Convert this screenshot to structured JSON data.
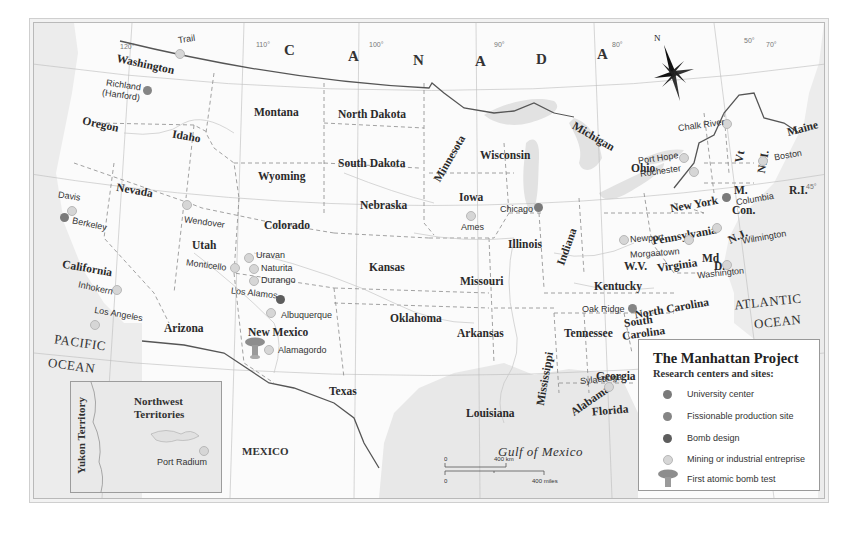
{
  "title": "The Manhattan Project",
  "legend": {
    "title": "The Manhattan Project",
    "subtitle": "Research centers and sites:",
    "items": [
      {
        "label": "University center",
        "type": "univ",
        "color": "#7a7a7a"
      },
      {
        "label": "Fissionable production site",
        "type": "fiss",
        "color": "#858585"
      },
      {
        "label": "Bomb design",
        "type": "bomb",
        "color": "#5d5d5d"
      },
      {
        "label": "Mining or industrial entreprise",
        "type": "mining",
        "color": "#d6d6d6"
      },
      {
        "label": "First atomic bomb test",
        "type": "test",
        "color": "#8a8a8a"
      }
    ]
  },
  "country_labels": {
    "canada_letters": [
      "C",
      "A",
      "N",
      "A",
      "D",
      "A"
    ],
    "mexico": "MEXICO"
  },
  "oceans": {
    "pacific_1": "PACIFIC",
    "pacific_2": "OCEAN",
    "atlantic_1": "ATLANTIC",
    "atlantic_2": "OCEAN",
    "gulf": "Gulf of Mexico"
  },
  "degrees": {
    "d120": "120°",
    "d110": "110°",
    "d100": "100°",
    "d90": "90°",
    "d80": "80°",
    "d70": "70°",
    "d50": "50°",
    "d45": "45°",
    "d30": "30°"
  },
  "compass": {
    "north": "N"
  },
  "states": {
    "washington": "Washington",
    "oregon": "Oregon",
    "california": "California",
    "idaho": "Idaho",
    "nevada": "Nevada",
    "montana": "Montana",
    "wyoming": "Wyoming",
    "utah": "Utah",
    "colorado": "Colorado",
    "arizona": "Arizona",
    "new_mexico": "New Mexico",
    "north_dakota": "North Dakota",
    "south_dakota": "South Dakota",
    "nebraska": "Nebraska",
    "kansas": "Kansas",
    "oklahoma": "Oklahoma",
    "texas": "Texas",
    "minnesota": "Minnesota",
    "iowa": "Iowa",
    "missouri": "Missouri",
    "arkansas": "Arkansas",
    "louisiana": "Louisiana",
    "wisconsin": "Wisconsin",
    "illinois": "Illinois",
    "michigan": "Michigan",
    "indiana": "Indiana",
    "ohio": "Ohio",
    "kentucky": "Kentucky",
    "tennessee": "Tennessee",
    "mississippi": "Mississippi",
    "alabama": "Alabama",
    "georgia": "Georgia",
    "florida": "Florida",
    "south_carolina_1": "South",
    "south_carolina_2": "Carolina",
    "north_carolina": "North Carolina",
    "virginia": "Virginia",
    "west_virginia": "W.V.",
    "maryland": "Md",
    "delaware": "D.",
    "pennsylvania": "Pennsylvania",
    "new_york": "New York",
    "new_jersey": "N.J.",
    "connecticut": "Con.",
    "rhode_island": "R.I.",
    "massachusetts": "M.",
    "vermont": "Vt",
    "new_hampshire": "N.H.",
    "maine": "Maine"
  },
  "inset": {
    "northwest_1": "Northwest",
    "northwest_2": "Territories",
    "yukon": "Yukon Territory",
    "site": "Port Radium"
  },
  "sites": [
    {
      "name": "Trail",
      "type": "mining"
    },
    {
      "name": "Richland",
      "name2": "(Hanford)",
      "type": "fiss"
    },
    {
      "name": "Davis",
      "type": "mining"
    },
    {
      "name": "Berkeley",
      "type": "univ"
    },
    {
      "name": "Inhokern",
      "type": "mining"
    },
    {
      "name": "Los Angeles",
      "type": "mining"
    },
    {
      "name": "Wendover",
      "type": "mining"
    },
    {
      "name": "Monticello",
      "type": "mining"
    },
    {
      "name": "Uravan",
      "type": "mining"
    },
    {
      "name": "Naturita",
      "type": "mining"
    },
    {
      "name": "Durango",
      "type": "mining"
    },
    {
      "name": "Los Alamos",
      "type": "bomb"
    },
    {
      "name": "Albuquerque",
      "type": "mining"
    },
    {
      "name": "Alamagordo",
      "type": "mining"
    },
    {
      "name": "Ames",
      "type": "mining"
    },
    {
      "name": "Chicago",
      "type": "univ"
    },
    {
      "name": "Newport",
      "type": "mining"
    },
    {
      "name": "Morgaatown",
      "type": "mining"
    },
    {
      "name": "Washington",
      "type": "mining"
    },
    {
      "name": "Wilmington",
      "type": "mining"
    },
    {
      "name": "Columbia",
      "type": "univ"
    },
    {
      "name": "Boston",
      "type": "mining"
    },
    {
      "name": "Rochester",
      "type": "mining"
    },
    {
      "name": "Port Hope",
      "type": "mining"
    },
    {
      "name": "Chalk River",
      "type": "mining"
    },
    {
      "name": "Oak Ridge",
      "type": "fiss"
    },
    {
      "name": "Sylacauga",
      "type": "mining"
    },
    {
      "name": "Port Radium",
      "type": "mining"
    }
  ],
  "scale": {
    "km_zero": "0",
    "km_label": "400 km",
    "mi_zero": "0",
    "mi_label": "400 miles"
  }
}
